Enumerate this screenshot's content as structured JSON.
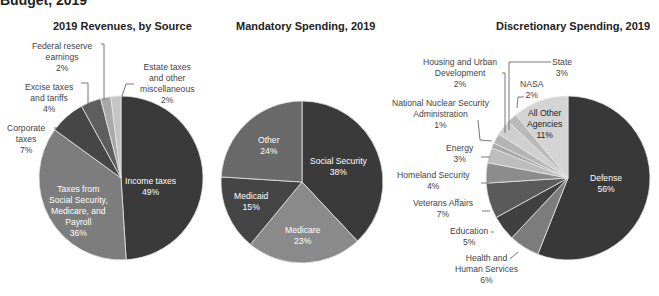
{
  "page": {
    "cut_heading": "Budget, 2019"
  },
  "chart_data": [
    {
      "type": "pie",
      "title": "2019 Revenues, by Source",
      "categories": [
        "Income taxes",
        "Taxes from Social Security, Medicare, and Payroll",
        "Corporate taxes",
        "Excise taxes and tariffs",
        "Federal reserve earnings",
        "Estate taxes and other miscellaneous"
      ],
      "values": [
        49,
        36,
        7,
        4,
        2,
        2
      ],
      "unit": "%",
      "colors": [
        "#3a3a3a",
        "#7d7d7d",
        "#464646",
        "#5e5e5e",
        "#a8a8a8",
        "#c4c4c4"
      ]
    },
    {
      "type": "pie",
      "title": "Mandatory Spending, 2019",
      "categories": [
        "Social Security",
        "Medicare",
        "Medicaid",
        "Other"
      ],
      "values": [
        38,
        23,
        15,
        24
      ],
      "unit": "%",
      "colors": [
        "#3a3a3a",
        "#8a8a8a",
        "#454545",
        "#6a6a6a"
      ]
    },
    {
      "type": "pie",
      "title": "Discretionary Spending, 2019",
      "categories": [
        "Defense",
        "Health and Human Services",
        "Education",
        "Veterans Affairs",
        "Homeland Security",
        "Energy",
        "National Nuclear Security Administration",
        "Housing and Urban Development",
        "State",
        "NASA",
        "All Other Agencies"
      ],
      "values": [
        56,
        6,
        5,
        7,
        4,
        3,
        1,
        2,
        3,
        2,
        11
      ],
      "unit": "%",
      "colors": [
        "#383838",
        "#7c7c7c",
        "#404040",
        "#5a5a5a",
        "#8c8c8c",
        "#bdbdbd",
        "#a6a6a6",
        "#b4b4b4",
        "#cfcfcf",
        "#b9b9b9",
        "#d4d4d4"
      ]
    }
  ],
  "titles": {
    "revenues": "2019 Revenues, by Source",
    "mandatory": "Mandatory Spending, 2019",
    "discretionary": "Discretionary Spending, 2019"
  },
  "labels": {
    "rev_income": [
      "Income taxes",
      "49%"
    ],
    "rev_ss": [
      "Taxes from",
      "Social Security,",
      "Medicare, and",
      "Payroll",
      "36%"
    ],
    "rev_corp": [
      "Corporate",
      "taxes",
      "7%"
    ],
    "rev_excise": [
      "Excise taxes",
      "and tariffs",
      "4%"
    ],
    "rev_fed": [
      "Federal reserve",
      "earnings",
      "2%"
    ],
    "rev_estate": [
      "Estate taxes",
      "and other",
      "miscellaneous",
      "2%"
    ],
    "man_ss": [
      "Social Security",
      "38%"
    ],
    "man_medicare": [
      "Medicare",
      "23%"
    ],
    "man_medicaid": [
      "Medicaid",
      "15%"
    ],
    "man_other": [
      "Other",
      "24%"
    ],
    "dis_defense": [
      "Defense",
      "56%"
    ],
    "dis_hhs": [
      "Health and",
      "Human Services",
      "6%"
    ],
    "dis_edu": [
      "Education",
      "5%"
    ],
    "dis_va": [
      "Veterans Affairs",
      "7%"
    ],
    "dis_hs": [
      "Homeland Security",
      "4%"
    ],
    "dis_energy": [
      "Energy",
      "3%"
    ],
    "dis_nnsa": [
      "National Nuclear Security",
      "Administration",
      "1%"
    ],
    "dis_hud": [
      "Housing and Urban",
      "Development",
      "2%"
    ],
    "dis_state": [
      "State",
      "3%"
    ],
    "dis_nasa": [
      "NASA",
      "2%"
    ],
    "dis_other": [
      "All Other",
      "Agencies",
      "11%"
    ]
  }
}
